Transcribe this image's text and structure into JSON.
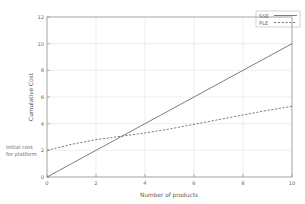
{
  "chart_data": {
    "type": "line",
    "title": "",
    "xlabel": "Number of products",
    "ylabel": "Cumulative Cost",
    "xlim": [
      0,
      10
    ],
    "ylim": [
      0,
      12
    ],
    "xticks": [
      "0",
      "2",
      "4",
      "6",
      "8",
      "10"
    ],
    "xtick_values": [
      0,
      2,
      4,
      6,
      8,
      10
    ],
    "yticks": [
      "0",
      "2",
      "4",
      "6",
      "8",
      "10",
      "12"
    ],
    "ytick_values": [
      0,
      2,
      4,
      6,
      8,
      10,
      12
    ],
    "grid": true,
    "legend_position": "top-right",
    "series": [
      {
        "name": "SSE",
        "style": "solid",
        "color": "#666666",
        "x": [
          0,
          1,
          2,
          3,
          4,
          5,
          6,
          7,
          8,
          9,
          10
        ],
        "values": [
          0,
          1,
          2,
          3,
          4,
          5,
          6,
          7,
          8,
          9,
          10
        ]
      },
      {
        "name": "PLE",
        "style": "dashed",
        "color": "#666666",
        "x": [
          0,
          1,
          2,
          3,
          4,
          5,
          6,
          7,
          8,
          9,
          10
        ],
        "values": [
          2.0,
          2.45,
          2.8,
          3.05,
          3.3,
          3.6,
          3.95,
          4.3,
          4.65,
          5.0,
          5.3
        ]
      }
    ],
    "annotations": [
      {
        "name": "initial-cost-annotation",
        "line1": "Initial cost",
        "line2": "for platform",
        "x": 0,
        "y": 2
      }
    ]
  }
}
